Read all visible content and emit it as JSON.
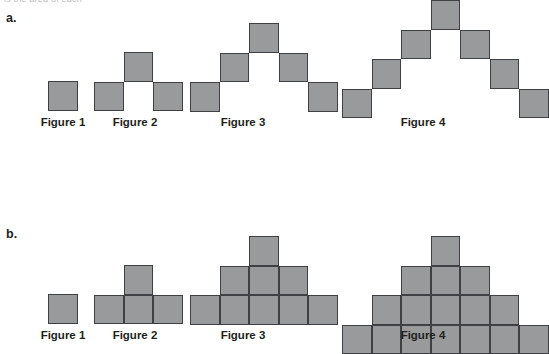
{
  "page": {
    "width": 524,
    "height": 349,
    "background": "#ffffff",
    "clipped_top_text": "is the area of each"
  },
  "style": {
    "cell_fill": "#999a9c",
    "cell_stroke": "#3f4044",
    "text_color": "#231f20",
    "cell_size": 29.5
  },
  "sections": [
    {
      "id": "a",
      "letter": "a.",
      "letter_x": 6,
      "letter_y": 12,
      "pattern": "chevron-outline",
      "figures": [
        {
          "label": "Figure 1",
          "origin_x": 48,
          "origin_y": 81,
          "label_x": 33,
          "label_y": 117,
          "label_width": 60,
          "square_count": 1,
          "cells": [
            [
              0,
              0
            ]
          ]
        },
        {
          "label": "Figure 2",
          "origin_x": 94,
          "origin_y": 52,
          "label_x": 105,
          "label_y": 117,
          "label_width": 60,
          "square_count": 3,
          "cells": [
            [
              0,
              1
            ],
            [
              1,
              0
            ],
            [
              2,
              1
            ]
          ]
        },
        {
          "label": "Figure 3",
          "origin_x": 190,
          "origin_y": 23,
          "label_x": 213,
          "label_y": 117,
          "label_width": 60,
          "square_count": 5,
          "cells": [
            [
              0,
              2
            ],
            [
              1,
              1
            ],
            [
              2,
              0
            ],
            [
              3,
              1
            ],
            [
              4,
              2
            ]
          ]
        },
        {
          "label": "Figure 4",
          "origin_x": 342,
          "origin_y": 0,
          "label_x": 393,
          "label_y": 117,
          "label_width": 60,
          "square_count": 7,
          "cells": [
            [
              0,
              3
            ],
            [
              1,
              2
            ],
            [
              2,
              1
            ],
            [
              3,
              0
            ],
            [
              4,
              1
            ],
            [
              5,
              2
            ],
            [
              6,
              3
            ]
          ]
        }
      ]
    },
    {
      "id": "b",
      "letter": "b.",
      "letter_x": 6,
      "letter_y": 228,
      "pattern": "filled-pyramid",
      "figures": [
        {
          "label": "Figure 1",
          "origin_x": 48,
          "origin_y": 294,
          "label_x": 33,
          "label_y": 330,
          "label_width": 60,
          "square_count": 1,
          "cells": [
            [
              0,
              0
            ]
          ]
        },
        {
          "label": "Figure 2",
          "origin_x": 94,
          "origin_y": 265,
          "label_x": 105,
          "label_y": 330,
          "label_width": 60,
          "square_count": 4,
          "cells": [
            [
              0,
              1
            ],
            [
              1,
              1
            ],
            [
              2,
              1
            ],
            [
              1,
              0
            ]
          ]
        },
        {
          "label": "Figure 3",
          "origin_x": 190,
          "origin_y": 236,
          "label_x": 213,
          "label_y": 330,
          "label_width": 60,
          "square_count": 9,
          "cells": [
            [
              0,
              2
            ],
            [
              1,
              2
            ],
            [
              2,
              2
            ],
            [
              3,
              2
            ],
            [
              4,
              2
            ],
            [
              1,
              1
            ],
            [
              2,
              1
            ],
            [
              3,
              1
            ],
            [
              2,
              0
            ]
          ]
        },
        {
          "label": "Figure 4",
          "origin_x": 342,
          "origin_y": 236,
          "label_x": 393,
          "label_y": 330,
          "label_width": 60,
          "square_count": 16,
          "cells": [
            [
              0,
              3
            ],
            [
              1,
              3
            ],
            [
              2,
              3
            ],
            [
              3,
              3
            ],
            [
              4,
              3
            ],
            [
              5,
              3
            ],
            [
              6,
              3
            ],
            [
              1,
              2
            ],
            [
              2,
              2
            ],
            [
              3,
              2
            ],
            [
              4,
              2
            ],
            [
              5,
              2
            ],
            [
              2,
              1
            ],
            [
              3,
              1
            ],
            [
              4,
              1
            ],
            [
              3,
              0
            ]
          ]
        }
      ]
    }
  ]
}
